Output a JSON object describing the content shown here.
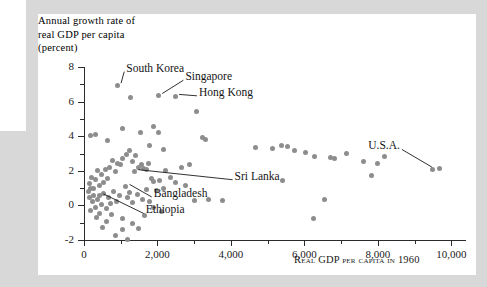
{
  "figure": {
    "y_axis_title_lines": [
      "Annual growth rate of",
      "real GDP per capita",
      "(percent)"
    ],
    "x_axis_title": "Real GDP per capita in 1960"
  },
  "chart_data": {
    "type": "scatter",
    "title": "",
    "xlabel": "Real GDP per capita in 1960",
    "ylabel": "Annual growth rate of real GDP per capita (percent)",
    "xlim": [
      0,
      10400
    ],
    "ylim": [
      -2,
      8
    ],
    "xticks": [
      0,
      2000,
      4000,
      6000,
      8000,
      10000
    ],
    "xtick_labels": [
      "0",
      "2,000",
      "4,000",
      "6,000",
      "8,000",
      "10,000"
    ],
    "xminor_ticks": [
      1000,
      3000,
      5000,
      7000,
      9000
    ],
    "yticks": [
      -2,
      0,
      2,
      4,
      6,
      8
    ],
    "ytick_labels": [
      "-2",
      "0",
      "2",
      "4",
      "6",
      "8"
    ],
    "yminor_ticks": [
      -1,
      1,
      3,
      5,
      7
    ],
    "grid": false,
    "legend": false,
    "point_color": "#8d8d8d",
    "annotations": [
      {
        "label": "South Korea",
        "text_x": 1150,
        "text_y": 7.85,
        "point_x": 900,
        "point_y": 6.95
      },
      {
        "label": "Singapore",
        "text_x": 2760,
        "text_y": 7.35,
        "point_x": 2020,
        "point_y": 6.35
      },
      {
        "label": "Hong Kong",
        "text_x": 3130,
        "text_y": 6.45,
        "point_x": 2480,
        "point_y": 6.3
      },
      {
        "label": "Sri Lanka",
        "text_x": 4100,
        "text_y": 1.6,
        "point_x": 1370,
        "point_y": 1.95
      },
      {
        "label": "Bangladesh",
        "text_x": 1900,
        "text_y": 0.6,
        "point_x": 1130,
        "point_y": 1.1
      },
      {
        "label": "Ethiopia",
        "text_x": 1680,
        "text_y": -0.35,
        "point_x": 420,
        "point_y": 0.55
      },
      {
        "label": "U.S.A.",
        "text_x": 8600,
        "text_y": 3.35,
        "point_x": 9580,
        "point_y": 2.1
      }
    ],
    "points": [
      [
        900,
        6.95
      ],
      [
        1270,
        6.25
      ],
      [
        2020,
        6.35
      ],
      [
        2480,
        6.3
      ],
      [
        3050,
        5.4
      ],
      [
        1050,
        4.45
      ],
      [
        1530,
        4.2
      ],
      [
        1900,
        4.55
      ],
      [
        2030,
        4.2
      ],
      [
        170,
        4.05
      ],
      [
        300,
        4.1
      ],
      [
        640,
        3.75
      ],
      [
        1780,
        3.45
      ],
      [
        2160,
        3.25
      ],
      [
        3220,
        3.95
      ],
      [
        3300,
        3.8
      ],
      [
        4680,
        3.35
      ],
      [
        5120,
        3.3
      ],
      [
        5380,
        3.45
      ],
      [
        5550,
        3.4
      ],
      [
        5720,
        3.2
      ],
      [
        6020,
        3.05
      ],
      [
        6280,
        2.85
      ],
      [
        6720,
        2.75
      ],
      [
        6820,
        2.7
      ],
      [
        7150,
        3.0
      ],
      [
        7620,
        2.55
      ],
      [
        7980,
        2.45
      ],
      [
        8180,
        2.8
      ],
      [
        9500,
        2.05
      ],
      [
        9680,
        2.15
      ],
      [
        7840,
        1.7
      ],
      [
        6540,
        0.35
      ],
      [
        5400,
        1.45
      ],
      [
        6250,
        -0.75
      ],
      [
        1150,
        2.95
      ],
      [
        1230,
        3.15
      ],
      [
        1310,
        2.55
      ],
      [
        1400,
        2.9
      ],
      [
        1480,
        2.2
      ],
      [
        1560,
        2.35
      ],
      [
        1620,
        2.15
      ],
      [
        1700,
        2.05
      ],
      [
        1760,
        2.4
      ],
      [
        1830,
        1.55
      ],
      [
        1900,
        1.4
      ],
      [
        1050,
        2.7
      ],
      [
        990,
        2.35
      ],
      [
        920,
        2.45
      ],
      [
        850,
        1.95
      ],
      [
        780,
        2.6
      ],
      [
        700,
        2.2
      ],
      [
        640,
        1.55
      ],
      [
        580,
        2.05
      ],
      [
        520,
        1.35
      ],
      [
        470,
        1.8
      ],
      [
        410,
        1.15
      ],
      [
        360,
        2.0
      ],
      [
        310,
        1.5
      ],
      [
        260,
        1.0
      ],
      [
        210,
        1.6
      ],
      [
        175,
        0.95
      ],
      [
        150,
        1.25
      ],
      [
        1370,
        1.95
      ],
      [
        1130,
        1.1
      ],
      [
        420,
        0.55
      ],
      [
        2230,
        2.0
      ],
      [
        2350,
        1.6
      ],
      [
        2480,
        1.35
      ],
      [
        2650,
        2.2
      ],
      [
        2760,
        1.15
      ],
      [
        2880,
        2.35
      ],
      [
        3010,
        0.3
      ],
      [
        3400,
        0.35
      ],
      [
        3780,
        0.3
      ],
      [
        2170,
        1.0
      ],
      [
        2050,
        1.45
      ],
      [
        1970,
        0.85
      ],
      [
        1250,
        0.75
      ],
      [
        1180,
        0.45
      ],
      [
        1320,
        0.15
      ],
      [
        1450,
        0.65
      ],
      [
        1580,
        0.35
      ],
      [
        1700,
        0.9
      ],
      [
        1790,
        0.2
      ],
      [
        1880,
        -0.1
      ],
      [
        960,
        0.6
      ],
      [
        880,
        0.25
      ],
      [
        800,
        0.8
      ],
      [
        730,
        0.1
      ],
      [
        660,
        0.45
      ],
      [
        600,
        -0.2
      ],
      [
        540,
        0.7
      ],
      [
        480,
        0.05
      ],
      [
        430,
        -0.45
      ],
      [
        370,
        0.35
      ],
      [
        320,
        -0.15
      ],
      [
        270,
        0.6
      ],
      [
        230,
        0.2
      ],
      [
        190,
        -0.3
      ],
      [
        145,
        0.45
      ],
      [
        110,
        0.8
      ],
      [
        620,
        -0.95
      ],
      [
        760,
        -0.55
      ],
      [
        1060,
        -0.75
      ],
      [
        1310,
        -1.05
      ],
      [
        1490,
        -1.35
      ],
      [
        1040,
        -1.4
      ],
      [
        870,
        -1.75
      ],
      [
        1190,
        -1.95
      ],
      [
        500,
        -1.25
      ],
      [
        1640,
        -0.6
      ],
      [
        2100,
        -0.35
      ],
      [
        340,
        -0.7
      ]
    ]
  }
}
